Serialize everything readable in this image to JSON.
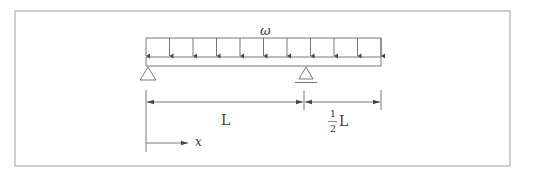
{
  "diagram": {
    "title": "",
    "labels": {
      "load": "ω",
      "span_main": "L",
      "span_overhang_num": "1",
      "span_overhang_den": "2",
      "span_overhang_var": "L",
      "axis": "x"
    },
    "elements": {
      "frame": {
        "x": 15,
        "y": 11,
        "w": 495,
        "h": 155
      },
      "beam": {
        "x1": 146,
        "x2": 381,
        "top": 57,
        "bottom": 66
      },
      "distributed_load": {
        "x1": 146,
        "x2": 381,
        "top": 38,
        "arrow_tip": 56,
        "arrow_count": 11
      },
      "supports": [
        {
          "type": "pin",
          "x": 148,
          "y": 67
        },
        {
          "type": "roller",
          "x": 306,
          "y": 67
        }
      ],
      "dimensions": [
        {
          "from": 146,
          "to": 304,
          "y": 102,
          "label": "L"
        },
        {
          "from": 304,
          "to": 381,
          "y": 102,
          "label": "1/2 L"
        }
      ],
      "axis_arrow": {
        "x1": 146,
        "x2": 188,
        "y": 143
      }
    },
    "colors": {
      "line": "#555555",
      "frame": "#9a9a9a",
      "text": "#3a3a3a"
    }
  }
}
